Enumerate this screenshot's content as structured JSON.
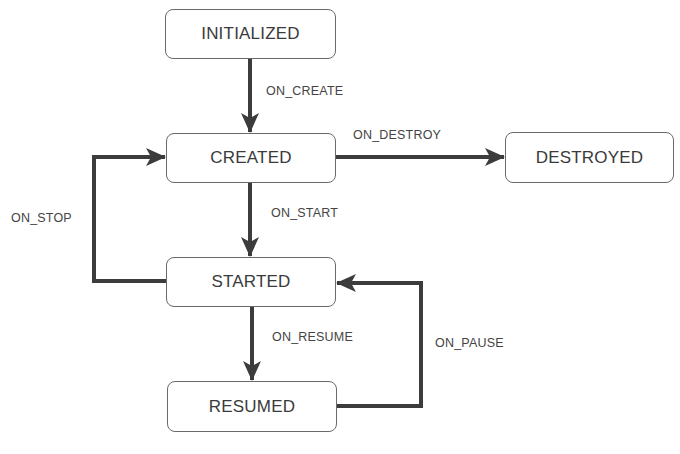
{
  "diagram": {
    "type": "state-machine",
    "states": [
      {
        "id": "initialized",
        "label": "INITIALIZED"
      },
      {
        "id": "created",
        "label": "CREATED"
      },
      {
        "id": "destroyed",
        "label": "DESTROYED"
      },
      {
        "id": "started",
        "label": "STARTED"
      },
      {
        "id": "resumed",
        "label": "RESUMED"
      }
    ],
    "transitions": [
      {
        "from": "initialized",
        "to": "created",
        "label": "ON_CREATE"
      },
      {
        "from": "created",
        "to": "destroyed",
        "label": "ON_DESTROY"
      },
      {
        "from": "created",
        "to": "started",
        "label": "ON_START"
      },
      {
        "from": "started",
        "to": "created",
        "label": "ON_STOP"
      },
      {
        "from": "started",
        "to": "resumed",
        "label": "ON_RESUME"
      },
      {
        "from": "resumed",
        "to": "started",
        "label": "ON_PAUSE"
      }
    ],
    "colors": {
      "arrow": "#3c3c3c",
      "box_border": "#6a6a6a",
      "text": "#3a3a3a"
    }
  }
}
